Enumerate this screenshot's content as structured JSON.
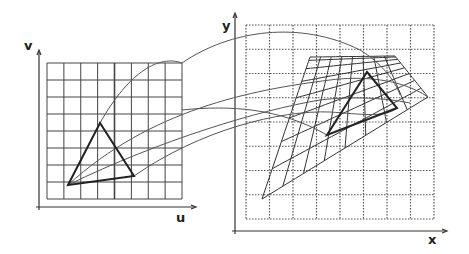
{
  "diagram": {
    "source": {
      "axis_u_label": "u",
      "axis_v_label": "v",
      "grid": {
        "cols": 8,
        "rows": 8,
        "style": "solid"
      },
      "triangle": [
        [
          68,
          185
        ],
        [
          100,
          123
        ],
        [
          134,
          176
        ]
      ]
    },
    "target": {
      "axis_x_label": "x",
      "axis_y_label": "y",
      "grid": {
        "cols": 8,
        "rows": 8,
        "style": "dotted"
      },
      "warped_mesh_corners": {
        "tl": [
          310,
          57
        ],
        "tr": [
          395,
          56
        ],
        "br": [
          428,
          97
        ],
        "bl": [
          262,
          199
        ]
      },
      "triangle": [
        [
          367,
          72
        ],
        [
          397,
          108
        ],
        [
          327,
          135
        ]
      ]
    },
    "colors": {
      "line": "#333333",
      "grid": "#444444",
      "background": "#ffffff"
    }
  }
}
